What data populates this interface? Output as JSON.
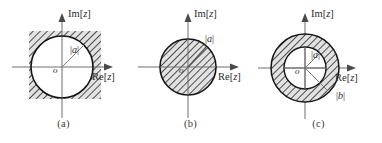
{
  "figure": {
    "title": "",
    "background_color": "#ffffff",
    "line_color": "#1a1a1a",
    "hatch_color": "#4d4d4d",
    "hatch_fill": "#d9d9d9",
    "panels": [
      {
        "id": "a",
        "caption": "(a)",
        "region": "exterior-of-circle",
        "imaginary_axis_label_prefix": "Im[",
        "imaginary_axis_label_var": "z",
        "imaginary_axis_label_suffix": "]",
        "real_axis_label_prefix": "Re[",
        "real_axis_label_var": "z",
        "real_axis_label_suffix": "]",
        "origin_label": "o",
        "radius_label_open": "|",
        "radius_label_var": "a",
        "radius_label_close": "|",
        "center": [
          62,
          67
        ],
        "radius": 31,
        "shaded_square": [
          29,
          31,
          72,
          68
        ]
      },
      {
        "id": "b",
        "caption": "(b)",
        "region": "interior-of-circle",
        "imaginary_axis_label_prefix": "Im[",
        "imaginary_axis_label_var": "z",
        "imaginary_axis_label_suffix": "]",
        "real_axis_label_prefix": "Re[",
        "real_axis_label_var": "z",
        "real_axis_label_suffix": "]",
        "origin_label": "o",
        "radius_label_open": "|",
        "radius_label_var": "a",
        "radius_label_close": "|",
        "center": [
          188,
          67
        ],
        "radius": 28
      },
      {
        "id": "c",
        "caption": "(c)",
        "region": "annulus",
        "imaginary_axis_label_prefix": "Im[",
        "imaginary_axis_label_var": "z",
        "imaginary_axis_label_suffix": "]",
        "real_axis_label_prefix": "Re[",
        "real_axis_label_var": "z",
        "real_axis_label_suffix": "]",
        "origin_label": "o",
        "inner_radius_label_open": "|",
        "inner_radius_label_var": "a",
        "inner_radius_label_close": "|",
        "outer_radius_label_open": "|",
        "outer_radius_label_var": "b",
        "outer_radius_label_close": "|",
        "center": [
          305,
          68
        ],
        "inner_radius": 21,
        "outer_radius": 34
      }
    ]
  }
}
